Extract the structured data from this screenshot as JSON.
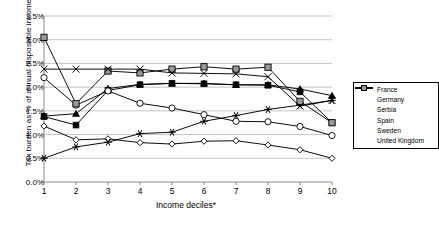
{
  "chart_data": {
    "type": "line",
    "title": "",
    "xlabel": "Income deciles*",
    "ylabel": "Tax burden as % of annual disposable income",
    "categories": [
      "1",
      "2",
      "3",
      "4",
      "5",
      "6",
      "7",
      "8",
      "9",
      "10"
    ],
    "x": [
      1,
      2,
      3,
      4,
      5,
      6,
      7,
      8,
      9,
      10
    ],
    "ylim": [
      0,
      3.5
    ],
    "ytick_labels": [
      "0.0%",
      "0.5%",
      "1.0%",
      "1.5%",
      "2.0%",
      "2.5%",
      "3.0%",
      "3.5%"
    ],
    "ytick_values": [
      0,
      0.5,
      1.0,
      1.5,
      2.0,
      2.5,
      3.0,
      3.5
    ],
    "grid": "horizontal",
    "legend_position": "right",
    "units": "percent",
    "series": [
      {
        "name": "France",
        "marker": "open-diamond",
        "values": [
          1.18,
          0.89,
          0.91,
          0.83,
          0.8,
          0.86,
          0.87,
          0.78,
          0.68,
          0.5
        ]
      },
      {
        "name": "Germany",
        "marker": "filled-triangle",
        "values": [
          1.39,
          1.44,
          1.97,
          2.06,
          2.08,
          2.08,
          2.05,
          2.05,
          1.96,
          1.82
        ]
      },
      {
        "name": "Serbia",
        "marker": "filled-square",
        "values": [
          1.38,
          1.2,
          1.93,
          2.05,
          2.08,
          2.07,
          2.05,
          2.04,
          1.9,
          1.25
        ]
      },
      {
        "name": "Spain",
        "marker": "star",
        "values": [
          0.5,
          0.74,
          0.84,
          1.02,
          1.05,
          1.28,
          1.4,
          1.53,
          1.62,
          1.72
        ]
      },
      {
        "name": "Sweden",
        "marker": "open-circle",
        "values": [
          2.2,
          1.62,
          1.92,
          1.66,
          1.56,
          1.42,
          1.28,
          1.27,
          1.17,
          0.98
        ]
      },
      {
        "name": "United Kingdom",
        "marker": "open-square",
        "values": [
          3.05,
          1.65,
          2.34,
          2.3,
          2.38,
          2.43,
          2.38,
          2.42,
          1.7,
          1.25
        ]
      }
    ],
    "spain_overlay": {
      "name": "Spain",
      "marker": "x-cross",
      "values": [
        2.38,
        2.38,
        2.38,
        2.38,
        2.3,
        2.29,
        2.28,
        2.22,
        1.6,
        1.72
      ]
    }
  },
  "legend": {
    "items": [
      "France",
      "Germany",
      "Serbia",
      "Spain",
      "Sweden",
      "United Kingdom"
    ]
  },
  "colors": {
    "line": "#000000",
    "grid": "#aaaaaa",
    "axis": "#808080",
    "uk_marker_fill": "#9a9a9a",
    "background": "#ffffff"
  }
}
